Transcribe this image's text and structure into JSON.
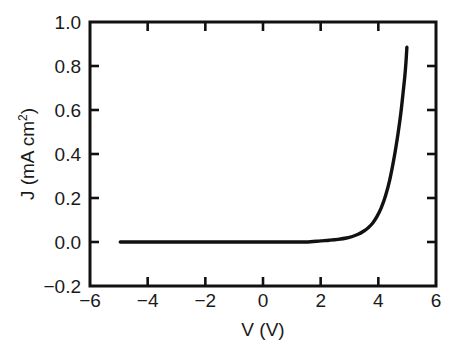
{
  "chart_data": {
    "type": "line",
    "title": "",
    "subtitle": "",
    "xlabel": "V (V)",
    "ylabel_prefix": "J (mA cm",
    "ylabel_sup": "2",
    "ylabel_suffix": ")",
    "ylabel": "J (mA cm2)",
    "xlim": [
      -6,
      6
    ],
    "ylim": [
      -0.2,
      1.0
    ],
    "xticks": [
      -6,
      -4,
      -2,
      0,
      2,
      4,
      6
    ],
    "xticklabels": [
      "−6",
      "−4",
      "−2",
      "0",
      "2",
      "4",
      "6"
    ],
    "yticks": [
      -0.2,
      0.0,
      0.2,
      0.4,
      0.6,
      0.8,
      1.0
    ],
    "yticklabels": [
      "−0.2",
      "0.0",
      "0.2",
      "0.4",
      "0.6",
      "0.8",
      "1.0"
    ],
    "grid": false,
    "legend": "none",
    "line_color": "#111111",
    "line_width": 3.4,
    "series": [
      {
        "name": "J-V curve",
        "x": [
          -4.95,
          -4.5,
          -4.0,
          -3.5,
          -3.0,
          -2.5,
          -2.0,
          -1.5,
          -1.0,
          -0.5,
          0.0,
          0.5,
          1.0,
          1.5,
          2.0,
          2.3,
          2.6,
          2.9,
          3.1,
          3.3,
          3.5,
          3.65,
          3.8,
          3.95,
          4.1,
          4.25,
          4.4,
          4.55,
          4.68,
          4.78,
          4.86,
          4.92,
          4.96,
          4.99
        ],
        "y": [
          0.0,
          0.0,
          0.0,
          0.0,
          0.0,
          0.0,
          0.0,
          0.0,
          0.0,
          0.0,
          0.0,
          0.0,
          0.0,
          0.0,
          0.005,
          0.008,
          0.012,
          0.018,
          0.025,
          0.035,
          0.05,
          0.065,
          0.085,
          0.115,
          0.155,
          0.21,
          0.285,
          0.385,
          0.49,
          0.585,
          0.68,
          0.755,
          0.82,
          0.885
        ]
      }
    ]
  }
}
